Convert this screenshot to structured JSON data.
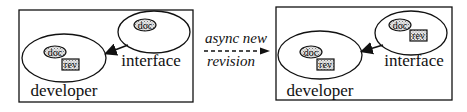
{
  "diagram": {
    "before": {
      "frame_label": "",
      "developer": {
        "label": "developer",
        "items": [
          {
            "type": "doc",
            "label": "doc"
          },
          {
            "type": "rev",
            "label": "rev"
          }
        ]
      },
      "interface": {
        "label": "interface",
        "items": [
          {
            "type": "doc",
            "label": "doc"
          }
        ]
      }
    },
    "transition": {
      "line1": "async new",
      "line2": "revision"
    },
    "after": {
      "developer": {
        "label": "developer",
        "items": [
          {
            "type": "doc",
            "label": "doc"
          },
          {
            "type": "rev",
            "label": "rev"
          }
        ]
      },
      "interface": {
        "label": "interface",
        "items": [
          {
            "type": "doc",
            "label": "doc"
          },
          {
            "type": "rev",
            "label": "rev"
          }
        ]
      }
    }
  },
  "colors": {
    "stroke": "#111111",
    "fill_pattern": "#bdbdbd",
    "background": "#ffffff"
  }
}
